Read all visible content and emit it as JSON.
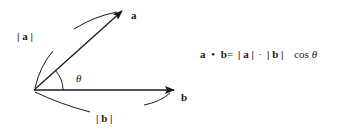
{
  "diagram": {
    "vector_a": {
      "label": "a",
      "magnitude_label": "| a |"
    },
    "vector_b": {
      "label": "b",
      "magnitude_label": "| b |"
    },
    "angle_label": "θ",
    "colors": {
      "stroke": "#1a1a1a",
      "background": "#ffffff"
    }
  },
  "formula": {
    "a": "a",
    "dot": "•",
    "b": "b",
    "eq": "=",
    "abs_a": "| a |",
    "cdot": "·",
    "abs_b": "| b |",
    "cos": "cos",
    "theta": "θ"
  }
}
